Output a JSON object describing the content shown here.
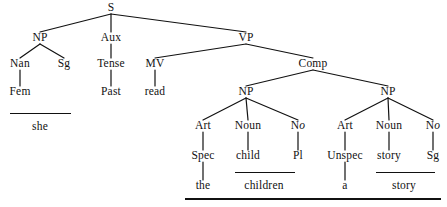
{
  "diagram": {
    "type": "syntax-tree",
    "sentence": "she read the children a story",
    "width": 447,
    "height": 207,
    "ink_color": "#111111",
    "background_color": "#ffffff"
  },
  "nodes": [
    {
      "id": "s",
      "label": "S",
      "x": 111,
      "y": 8,
      "role": "category"
    },
    {
      "id": "np1",
      "label": "NP",
      "x": 40,
      "y": 38,
      "role": "category"
    },
    {
      "id": "aux",
      "label": "Aux",
      "x": 111,
      "y": 38,
      "role": "category"
    },
    {
      "id": "vp",
      "label": "VP",
      "x": 246,
      "y": 38,
      "role": "category"
    },
    {
      "id": "nan",
      "label": "Nan",
      "x": 20,
      "y": 64,
      "role": "feature"
    },
    {
      "id": "sg1",
      "label": "Sg",
      "x": 64,
      "y": 64,
      "role": "feature"
    },
    {
      "id": "tense",
      "label": "Tense",
      "x": 111,
      "y": 64,
      "role": "category"
    },
    {
      "id": "mv",
      "label": "MV",
      "x": 155,
      "y": 64,
      "role": "category"
    },
    {
      "id": "comp",
      "label": "Comp",
      "x": 313,
      "y": 64,
      "role": "category"
    },
    {
      "id": "fem",
      "label": "Fem",
      "x": 20,
      "y": 92,
      "role": "feature"
    },
    {
      "id": "past",
      "label": "Past",
      "x": 111,
      "y": 92,
      "role": "feature"
    },
    {
      "id": "read",
      "label": "read",
      "x": 155,
      "y": 92,
      "role": "word"
    },
    {
      "id": "np2",
      "label": "NP",
      "x": 246,
      "y": 92,
      "role": "category"
    },
    {
      "id": "np3",
      "label": "NP",
      "x": 388,
      "y": 92,
      "role": "category"
    },
    {
      "id": "art1",
      "label": "Art",
      "x": 203,
      "y": 126,
      "role": "category"
    },
    {
      "id": "noun1",
      "label": "Noun",
      "x": 248,
      "y": 126,
      "role": "category"
    },
    {
      "id": "no1",
      "label": "No",
      "x": 298,
      "y": 126,
      "role": "category",
      "italic_tail": "o"
    },
    {
      "id": "art2",
      "label": "Art",
      "x": 345,
      "y": 126,
      "role": "category"
    },
    {
      "id": "noun2",
      "label": "Noun",
      "x": 389,
      "y": 126,
      "role": "category"
    },
    {
      "id": "no2",
      "label": "No",
      "x": 433,
      "y": 126,
      "role": "category",
      "italic_tail": "o"
    },
    {
      "id": "spec",
      "label": "Spec",
      "x": 203,
      "y": 156,
      "role": "feature"
    },
    {
      "id": "child",
      "label": "child",
      "x": 248,
      "y": 156,
      "role": "word"
    },
    {
      "id": "pl",
      "label": "Pl",
      "x": 298,
      "y": 156,
      "role": "feature"
    },
    {
      "id": "unspec",
      "label": "Unspec",
      "x": 345,
      "y": 156,
      "role": "feature"
    },
    {
      "id": "story",
      "label": "story",
      "x": 389,
      "y": 156,
      "role": "word"
    },
    {
      "id": "sg2",
      "label": "Sg",
      "x": 433,
      "y": 156,
      "role": "feature"
    },
    {
      "id": "w-the",
      "label": "the",
      "x": 203,
      "y": 186,
      "role": "word"
    },
    {
      "id": "w-children",
      "label": "children",
      "x": 264,
      "y": 186,
      "role": "word"
    },
    {
      "id": "w-a",
      "label": "a",
      "x": 345,
      "y": 186,
      "role": "word"
    },
    {
      "id": "w-story",
      "label": "story",
      "x": 404,
      "y": 186,
      "role": "word"
    },
    {
      "id": "w-she",
      "label": "she",
      "x": 40,
      "y": 127,
      "role": "word"
    }
  ],
  "edges": [
    {
      "from": "s",
      "to": "np1"
    },
    {
      "from": "s",
      "to": "aux"
    },
    {
      "from": "s",
      "to": "vp"
    },
    {
      "from": "np1",
      "to": "nan"
    },
    {
      "from": "np1",
      "to": "sg1"
    },
    {
      "from": "aux",
      "to": "tense"
    },
    {
      "from": "vp",
      "to": "mv"
    },
    {
      "from": "vp",
      "to": "comp"
    },
    {
      "from": "nan",
      "to": "fem"
    },
    {
      "from": "tense",
      "to": "past"
    },
    {
      "from": "mv",
      "to": "read"
    },
    {
      "from": "comp",
      "to": "np2"
    },
    {
      "from": "comp",
      "to": "np3"
    },
    {
      "from": "np2",
      "to": "art1"
    },
    {
      "from": "np2",
      "to": "noun1"
    },
    {
      "from": "np2",
      "to": "no1"
    },
    {
      "from": "np3",
      "to": "art2"
    },
    {
      "from": "np3",
      "to": "noun2"
    },
    {
      "from": "np3",
      "to": "no2"
    },
    {
      "from": "art1",
      "to": "spec"
    },
    {
      "from": "noun1",
      "to": "child"
    },
    {
      "from": "no1",
      "to": "pl"
    },
    {
      "from": "art2",
      "to": "unspec"
    },
    {
      "from": "noun2",
      "to": "story"
    },
    {
      "from": "no2",
      "to": "sg2"
    },
    {
      "from": "spec",
      "to": "w-the"
    },
    {
      "from": "unspec",
      "to": "w-a"
    }
  ],
  "rules": [
    {
      "id": "rule-she",
      "x": 10,
      "y": 113,
      "width": 61,
      "thick": false
    },
    {
      "id": "rule-children",
      "x": 235,
      "y": 172,
      "width": 60,
      "thick": false
    },
    {
      "id": "rule-story",
      "x": 376,
      "y": 172,
      "width": 59,
      "thick": false
    },
    {
      "id": "rule-clause",
      "x": 185,
      "y": 198,
      "width": 256,
      "thick": true
    }
  ]
}
